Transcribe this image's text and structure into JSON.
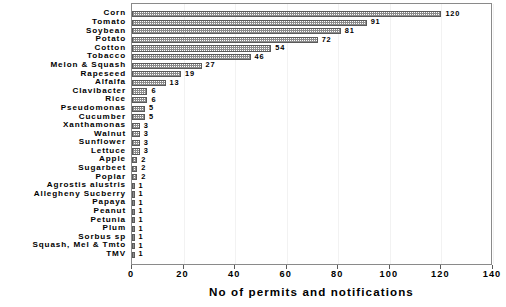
{
  "chart_data": {
    "type": "bar",
    "orientation": "horizontal",
    "title": "",
    "xlabel": "No of permits and notifications",
    "ylabel": "",
    "xlim": [
      0,
      140
    ],
    "xticks": [
      0,
      20,
      40,
      60,
      80,
      100,
      120,
      140
    ],
    "grid": true,
    "legend": null,
    "categories": [
      "Corn",
      "Tomato",
      "Soybean",
      "Potato",
      "Cotton",
      "Tobacco",
      "Melon & Squash",
      "Rapeseed",
      "Alfalfa",
      "Clavibacter",
      "Rice",
      "Pseudomonas",
      "Cucumber",
      "Xanthamonas",
      "Walnut",
      "Sunflower",
      "Lettuce",
      "Apple",
      "Sugarbeet",
      "Poplar",
      "Agrostis alustris",
      "Allegheny Sucberry",
      "Papaya",
      "Peanut",
      "Petunia",
      "Plum",
      "Sorbus sp",
      "Squash, Mel & Tmto",
      "TMV"
    ],
    "values": [
      120,
      91,
      81,
      72,
      54,
      46,
      27,
      19,
      13,
      6,
      6,
      5,
      5,
      3,
      3,
      3,
      3,
      2,
      2,
      2,
      1,
      1,
      1,
      1,
      1,
      1,
      1,
      1,
      1
    ],
    "value_labels": [
      "120",
      "91",
      "81",
      "72",
      "54",
      "46",
      "27",
      "19",
      "13",
      "6",
      "6",
      "5",
      "5",
      "3",
      "3",
      "3",
      "3",
      "2",
      "2",
      "2",
      "1",
      "1",
      "1",
      "1",
      "1",
      "1",
      "1",
      "1",
      "1"
    ]
  },
  "style": {
    "bar_fill": "#8c8c8c",
    "bar_edge": "#5a5a5a",
    "frame_color": "#8a8a8a",
    "grid_color": "#f2f2f2",
    "background": "#ffffff",
    "text_color": "#000000"
  }
}
